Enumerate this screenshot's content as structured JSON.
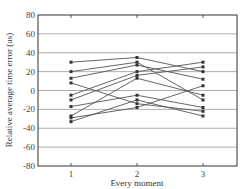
{
  "chart_data": {
    "type": "line",
    "title": "",
    "xlabel": "Every moment",
    "ylabel": "Relative average time error  (us)",
    "categories": [
      "1",
      "2",
      "3"
    ],
    "x": [
      1,
      2,
      3
    ],
    "ylim": [
      -80,
      80
    ],
    "yticks": [
      80,
      60,
      40,
      20,
      0,
      -20,
      -40,
      -60,
      -80
    ],
    "xticks": [
      1,
      2,
      3
    ],
    "grid": "horizontal",
    "legend": null,
    "marker": "square",
    "line_color": "#555555",
    "series": [
      {
        "name": "s1",
        "values": [
          30,
          35,
          20
        ]
      },
      {
        "name": "s2",
        "values": [
          20,
          30,
          -10
        ]
      },
      {
        "name": "s3",
        "values": [
          13,
          27,
          12
        ]
      },
      {
        "name": "s4",
        "values": [
          8,
          -14,
          -22
        ]
      },
      {
        "name": "s5",
        "values": [
          -5,
          20,
          30
        ]
      },
      {
        "name": "s6",
        "values": [
          -10,
          16,
          25
        ]
      },
      {
        "name": "s7",
        "values": [
          -17,
          -5,
          -18
        ]
      },
      {
        "name": "s8",
        "values": [
          -27,
          13,
          -5
        ]
      },
      {
        "name": "s9",
        "values": [
          -29,
          -18,
          5
        ]
      },
      {
        "name": "s10",
        "values": [
          -33,
          -10,
          -27
        ]
      }
    ]
  }
}
